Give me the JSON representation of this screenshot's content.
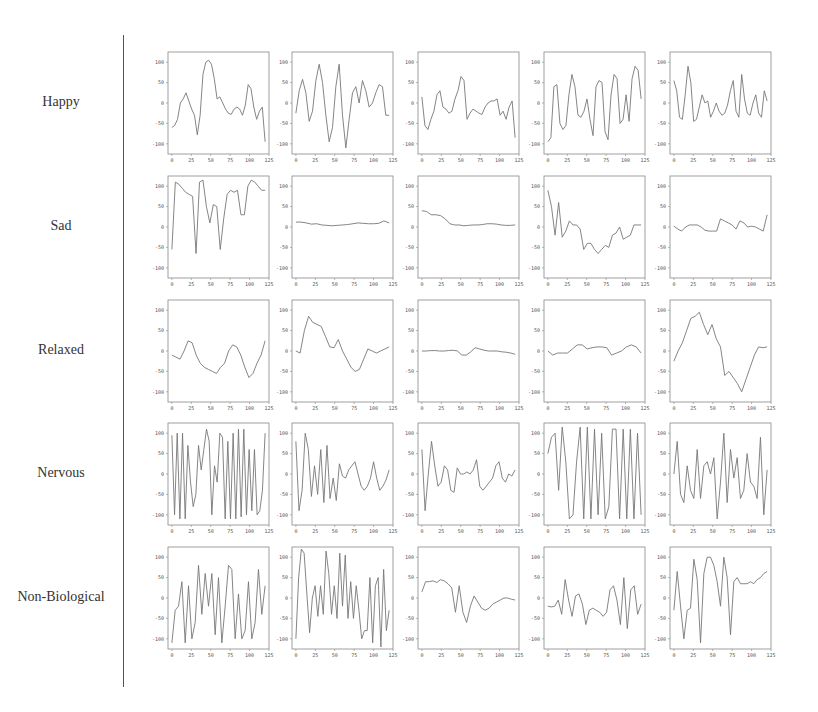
{
  "figure": {
    "rows": [
      "Happy",
      "Sad",
      "Relaxed",
      "Nervous",
      "Non-Biological"
    ],
    "x_ticks": [
      0,
      25,
      50,
      75,
      100,
      125
    ],
    "y_ticks": [
      100,
      50,
      0,
      -50,
      -100
    ],
    "line_color": "#777777",
    "axis_color": "#888888"
  },
  "chart_data": {
    "type": "line",
    "layout": "grid 5 rows x 5 columns of small multiples",
    "xlim": [
      -5,
      125
    ],
    "ylim": [
      -125,
      125
    ],
    "x_tick_labels": [
      "0",
      "25",
      "50",
      "75",
      "100",
      "125"
    ],
    "y_tick_labels": [
      "100",
      "50",
      "0",
      "-50",
      "-100"
    ],
    "grid": false,
    "row_labels": [
      "Happy",
      "Sad",
      "Relaxed",
      "Nervous",
      "Non-Biological"
    ],
    "x_step": 5,
    "panels": [
      [
        {
          "values": [
            -60,
            -55,
            -40,
            0,
            10,
            25,
            5,
            -15,
            -30,
            -78,
            -30,
            70,
            100,
            105,
            95,
            60,
            10,
            15,
            0,
            -15,
            -25,
            -28,
            -15,
            -10,
            -15,
            -30,
            -5,
            45,
            35,
            -10,
            -40,
            -20,
            -10,
            -95
          ]
        },
        {
          "values": [
            -25,
            30,
            58,
            25,
            -45,
            -20,
            55,
            95,
            50,
            -30,
            -95,
            -60,
            40,
            95,
            -30,
            -110,
            -40,
            25,
            40,
            0,
            55,
            30,
            -10,
            0,
            25,
            45,
            40,
            -30,
            -30
          ]
        },
        {
          "values": [
            15,
            -55,
            -65,
            -40,
            -20,
            20,
            30,
            -10,
            -15,
            -25,
            -20,
            10,
            30,
            65,
            55,
            -40,
            -25,
            -15,
            -20,
            -25,
            -28,
            -10,
            0,
            5,
            5,
            10,
            -30,
            -20,
            -40,
            -10,
            5,
            -85
          ]
        },
        {
          "values": [
            -95,
            -85,
            40,
            45,
            -50,
            -65,
            -55,
            20,
            70,
            40,
            -30,
            -35,
            -20,
            10,
            -40,
            -80,
            40,
            55,
            50,
            -70,
            -90,
            20,
            70,
            60,
            -50,
            -40,
            20,
            -45,
            60,
            90,
            80,
            10
          ]
        },
        {
          "values": [
            55,
            30,
            -35,
            -40,
            20,
            90,
            50,
            -45,
            -40,
            -10,
            20,
            0,
            5,
            -35,
            -20,
            0,
            -20,
            -30,
            -25,
            -5,
            30,
            55,
            -20,
            -35,
            70,
            10,
            -25,
            -30,
            0,
            20,
            -25,
            -35,
            30,
            5
          ]
        }
      ],
      [
        {
          "values": [
            -55,
            110,
            105,
            95,
            85,
            80,
            75,
            -65,
            110,
            115,
            50,
            10,
            55,
            50,
            -55,
            20,
            80,
            90,
            85,
            90,
            30,
            30,
            100,
            115,
            110,
            100,
            90,
            90
          ]
        },
        {
          "values": [
            12,
            12,
            10,
            7,
            8,
            5,
            4,
            3,
            4,
            5,
            6,
            8,
            10,
            9,
            8,
            8,
            9,
            15,
            10
          ]
        },
        {
          "values": [
            40,
            38,
            30,
            30,
            28,
            20,
            8,
            5,
            5,
            3,
            4,
            5,
            5,
            6,
            8,
            8,
            7,
            5,
            4,
            4,
            5
          ]
        },
        {
          "values": [
            90,
            50,
            -20,
            60,
            -25,
            -10,
            15,
            5,
            5,
            -5,
            -55,
            -40,
            -40,
            -55,
            -65,
            -55,
            -45,
            -50,
            -20,
            -15,
            0,
            -30,
            -25,
            -20,
            5,
            5,
            5
          ]
        },
        {
          "values": [
            2,
            -5,
            -10,
            0,
            5,
            5,
            5,
            0,
            -8,
            -10,
            -10,
            -10,
            20,
            15,
            10,
            5,
            -5,
            15,
            10,
            0,
            2,
            0,
            -5,
            -10,
            30
          ]
        }
      ],
      [
        {
          "values": [
            -10,
            -15,
            -20,
            0,
            25,
            20,
            -10,
            -30,
            -40,
            -45,
            -50,
            -55,
            -40,
            -30,
            0,
            15,
            10,
            -10,
            -40,
            -65,
            -55,
            -30,
            -10,
            25
          ]
        },
        {
          "values": [
            0,
            -5,
            50,
            85,
            70,
            65,
            60,
            35,
            10,
            8,
            28,
            0,
            -20,
            -40,
            -50,
            -45,
            -20,
            5,
            0,
            -5,
            0,
            5,
            10
          ]
        },
        {
          "values": [
            0,
            0,
            1,
            1,
            0,
            0,
            1,
            2,
            0,
            -10,
            -10,
            -2,
            8,
            5,
            2,
            0,
            0,
            0,
            -2,
            -3,
            -5,
            -8
          ]
        },
        {
          "values": [
            0,
            -10,
            -5,
            -5,
            -5,
            5,
            15,
            15,
            5,
            8,
            10,
            10,
            8,
            -10,
            -5,
            0,
            10,
            15,
            10,
            -5
          ]
        },
        {
          "values": [
            -25,
            0,
            20,
            50,
            80,
            85,
            95,
            65,
            40,
            65,
            30,
            10,
            -60,
            -50,
            -65,
            -80,
            -100,
            -70,
            -40,
            -10,
            10,
            8,
            10
          ]
        }
      ],
      [
        {
          "values": [
            95,
            -100,
            100,
            -110,
            100,
            -110,
            70,
            -20,
            -80,
            -50,
            70,
            10,
            60,
            110,
            80,
            -100,
            20,
            -20,
            100,
            90,
            -110,
            80,
            -110,
            100,
            -110,
            110,
            -105,
            110,
            -100,
            60,
            -90,
            60,
            -100,
            -90,
            -40,
            100
          ]
        },
        {
          "values": [
            80,
            -90,
            -40,
            100,
            60,
            -55,
            20,
            -50,
            60,
            -70,
            70,
            -60,
            -10,
            -65,
            25,
            -5,
            -10,
            10,
            20,
            30,
            0,
            -30,
            -40,
            -30,
            -10,
            30,
            -10,
            -40,
            -30,
            -15,
            10
          ]
        },
        {
          "values": [
            60,
            -90,
            0,
            80,
            20,
            -30,
            -20,
            20,
            10,
            -40,
            -45,
            15,
            0,
            0,
            5,
            0,
            10,
            35,
            -30,
            -40,
            -30,
            -20,
            -10,
            20,
            30,
            -10,
            -20,
            0,
            -5,
            10
          ]
        },
        {
          "values": [
            50,
            90,
            100,
            -40,
            115,
            30,
            -110,
            -100,
            30,
            115,
            -110,
            115,
            -110,
            110,
            -100,
            100,
            -110,
            -80,
            110,
            110,
            -110,
            110,
            -110,
            110,
            -110,
            100,
            -100
          ]
        },
        {
          "values": [
            0,
            80,
            -50,
            -70,
            20,
            -40,
            -60,
            60,
            -60,
            20,
            30,
            0,
            40,
            -110,
            -20,
            100,
            -70,
            60,
            -10,
            40,
            -60,
            -40,
            50,
            -20,
            -30,
            -60,
            90,
            -100,
            10
          ]
        }
      ],
      [
        {
          "values": [
            -110,
            -30,
            -20,
            40,
            -110,
            30,
            -100,
            -60,
            80,
            -40,
            60,
            -20,
            60,
            -90,
            50,
            -110,
            -20,
            80,
            70,
            -100,
            10,
            -100,
            -80,
            40,
            -100,
            -60,
            70,
            -40,
            30
          ]
        },
        {
          "values": [
            -100,
            50,
            120,
            110,
            10,
            -85,
            0,
            30,
            -45,
            30,
            -40,
            115,
            60,
            -40,
            30,
            -50,
            110,
            -20,
            105,
            -50,
            40,
            -50,
            30,
            -30,
            -100,
            -80,
            -80,
            50,
            -110,
            30,
            50,
            -120,
            70,
            -80,
            -30
          ]
        },
        {
          "values": [
            15,
            40,
            40,
            42,
            38,
            45,
            42,
            35,
            25,
            -35,
            30,
            -35,
            -60,
            -20,
            5,
            -10,
            -25,
            -30,
            -25,
            -15,
            -10,
            -5,
            0,
            0,
            -3,
            -5
          ]
        },
        {
          "values": [
            -20,
            -22,
            -20,
            -5,
            -40,
            45,
            -5,
            -45,
            5,
            10,
            -15,
            -65,
            -30,
            -25,
            -30,
            -35,
            -45,
            -35,
            20,
            30,
            -5,
            -65,
            50,
            -75,
            20,
            30,
            -40,
            -15
          ]
        },
        {
          "values": [
            -30,
            65,
            -20,
            -100,
            -30,
            -25,
            95,
            45,
            -110,
            60,
            100,
            100,
            80,
            40,
            -20,
            100,
            50,
            -90,
            40,
            50,
            35,
            35,
            35,
            40,
            35,
            45,
            50,
            60,
            65
          ]
        }
      ]
    ]
  }
}
